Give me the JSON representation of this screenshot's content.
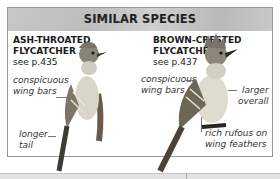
{
  "header": {
    "title": "SIMILAR SPECIES"
  },
  "species": [
    {
      "name_line1": "ASH-THROATED",
      "name_line2": "FLYCATCHER",
      "see": "see p.435",
      "notes": [
        {
          "line1": "conspicuous",
          "line2": "wing bars"
        },
        {
          "line1": "longer",
          "line2": "tail"
        }
      ]
    },
    {
      "name_line1": "BROWN-CRESTED",
      "name_line2": "FLYCATCHER",
      "see": "see p.437",
      "notes": [
        {
          "line1": "conspicuous",
          "line2": "wing bars"
        },
        {
          "line1": "larger",
          "line2": "overall"
        },
        {
          "line1": "rich rufous on",
          "line2": "wing feathers"
        }
      ]
    }
  ],
  "colors": {
    "band": "#c4c4c4",
    "border": "#9a9a9a"
  }
}
